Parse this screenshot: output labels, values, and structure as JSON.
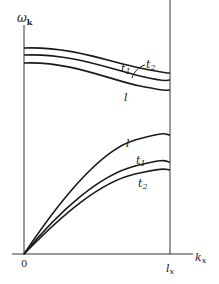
{
  "diagram": {
    "type": "dispersion-relation",
    "y_axis": {
      "label": "ω",
      "subscript": "k"
    },
    "x_axis": {
      "label": "k",
      "subscript": "x"
    },
    "origin_label": "0",
    "boundary": {
      "label": "l",
      "subscript": "x"
    },
    "optical_branch": {
      "labels": [
        "t1",
        "t2",
        "l"
      ],
      "label_t1": {
        "main": "t",
        "sub": "1"
      },
      "label_t2": {
        "main": "t",
        "sub": "2"
      },
      "label_l": "l"
    },
    "acoustic_branch": {
      "labels": [
        "l",
        "t1",
        "t2"
      ],
      "label_l": "l",
      "label_t1": {
        "main": "t",
        "sub": "1"
      },
      "label_t2": {
        "main": "t",
        "sub": "2"
      }
    }
  }
}
